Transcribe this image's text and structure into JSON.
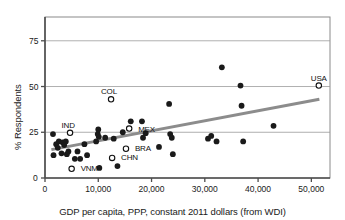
{
  "figure": {
    "clipped_title": "Support for the death penalty",
    "frame": {
      "left": 45,
      "top": 17,
      "right": 330,
      "bottom": 178
    }
  },
  "chart_data": {
    "type": "scatter",
    "title": "",
    "xlabel": "GDP per capita, PPP, constant 2011 dollars (from WDI)",
    "ylabel": "% Respondents",
    "xlim": [
      0,
      53500
    ],
    "ylim": [
      0,
      88
    ],
    "xticks": [
      0,
      10000,
      20000,
      30000,
      40000,
      50000
    ],
    "xticklabels": [
      "0",
      "10,000",
      "20,000",
      "30,000",
      "40,000",
      "50,000"
    ],
    "yticks": [
      0,
      25,
      50,
      75
    ],
    "yticklabels": [
      "0",
      "25",
      "50",
      "75"
    ],
    "grid": "horizontal",
    "gridlines_at": [
      25,
      50,
      75
    ],
    "marker_filled_color": "#1a1a1a",
    "marker_open_color": "#ffffff",
    "trendline_color": "#8c8c8c",
    "trendline": {
      "x0": 1200,
      "y0": 15.5,
      "x1": 51500,
      "y1": 43.0
    },
    "points": [
      {
        "x": 1500,
        "y": 24.0,
        "style": "filled",
        "label": ""
      },
      {
        "x": 1600,
        "y": 12.5,
        "style": "filled",
        "label": ""
      },
      {
        "x": 2100,
        "y": 18.5,
        "style": "filled",
        "label": ""
      },
      {
        "x": 2400,
        "y": 16.5,
        "style": "filled",
        "label": ""
      },
      {
        "x": 2600,
        "y": 20.0,
        "style": "filled",
        "label": ""
      },
      {
        "x": 3100,
        "y": 13.5,
        "style": "filled",
        "label": ""
      },
      {
        "x": 3300,
        "y": 19.5,
        "style": "filled",
        "label": ""
      },
      {
        "x": 3600,
        "y": 18.0,
        "style": "filled",
        "label": ""
      },
      {
        "x": 3900,
        "y": 20.0,
        "style": "filled",
        "label": ""
      },
      {
        "x": 4100,
        "y": 13.0,
        "style": "filled",
        "label": ""
      },
      {
        "x": 4400,
        "y": 14.5,
        "style": "filled",
        "label": ""
      },
      {
        "x": 4700,
        "y": 24.7,
        "style": "open",
        "label": "IND"
      },
      {
        "x": 5000,
        "y": 5.0,
        "style": "open",
        "label": "VNM"
      },
      {
        "x": 5600,
        "y": 10.5,
        "style": "filled",
        "label": ""
      },
      {
        "x": 6100,
        "y": 14.5,
        "style": "filled",
        "label": ""
      },
      {
        "x": 6600,
        "y": 10.5,
        "style": "filled",
        "label": ""
      },
      {
        "x": 7400,
        "y": 18.5,
        "style": "filled",
        "label": ""
      },
      {
        "x": 7900,
        "y": 12.5,
        "style": "filled",
        "label": ""
      },
      {
        "x": 9600,
        "y": 20.0,
        "style": "filled",
        "label": ""
      },
      {
        "x": 9900,
        "y": 24.0,
        "style": "filled",
        "label": ""
      },
      {
        "x": 10000,
        "y": 26.5,
        "style": "filled",
        "label": ""
      },
      {
        "x": 10100,
        "y": 22.5,
        "style": "filled",
        "label": ""
      },
      {
        "x": 10200,
        "y": 5.5,
        "style": "filled",
        "label": ""
      },
      {
        "x": 11300,
        "y": 22.0,
        "style": "filled",
        "label": ""
      },
      {
        "x": 12400,
        "y": 43.0,
        "style": "open",
        "label": "COL"
      },
      {
        "x": 12600,
        "y": 11.0,
        "style": "open",
        "label": "CHN"
      },
      {
        "x": 12900,
        "y": 21.5,
        "style": "filled",
        "label": ""
      },
      {
        "x": 13600,
        "y": 6.5,
        "style": "filled",
        "label": ""
      },
      {
        "x": 14600,
        "y": 25.0,
        "style": "filled",
        "label": ""
      },
      {
        "x": 15200,
        "y": 16.0,
        "style": "open",
        "label": "BRA"
      },
      {
        "x": 15800,
        "y": 27.0,
        "style": "open",
        "label": "MEX"
      },
      {
        "x": 16100,
        "y": 31.0,
        "style": "filled",
        "label": ""
      },
      {
        "x": 18200,
        "y": 31.0,
        "style": "filled",
        "label": ""
      },
      {
        "x": 18400,
        "y": 22.0,
        "style": "filled",
        "label": ""
      },
      {
        "x": 18900,
        "y": 24.5,
        "style": "filled",
        "label": ""
      },
      {
        "x": 21400,
        "y": 17.0,
        "style": "filled",
        "label": ""
      },
      {
        "x": 23300,
        "y": 40.5,
        "style": "filled",
        "label": ""
      },
      {
        "x": 23500,
        "y": 24.0,
        "style": "filled",
        "label": ""
      },
      {
        "x": 23800,
        "y": 22.0,
        "style": "filled",
        "label": ""
      },
      {
        "x": 24000,
        "y": 13.0,
        "style": "filled",
        "label": ""
      },
      {
        "x": 30600,
        "y": 21.5,
        "style": "filled",
        "label": ""
      },
      {
        "x": 31200,
        "y": 23.0,
        "style": "filled",
        "label": ""
      },
      {
        "x": 32200,
        "y": 20.0,
        "style": "filled",
        "label": ""
      },
      {
        "x": 33200,
        "y": 60.5,
        "style": "filled",
        "label": ""
      },
      {
        "x": 36700,
        "y": 50.5,
        "style": "filled",
        "label": ""
      },
      {
        "x": 36900,
        "y": 39.5,
        "style": "filled",
        "label": ""
      },
      {
        "x": 37200,
        "y": 20.0,
        "style": "filled",
        "label": ""
      },
      {
        "x": 42900,
        "y": 28.5,
        "style": "filled",
        "label": ""
      },
      {
        "x": 51400,
        "y": 50.5,
        "style": "open",
        "label": "USA"
      }
    ],
    "labeled_points": [
      {
        "label": "IND",
        "x": 4700,
        "y": 24.7,
        "label_dx": -2,
        "label_dy": -11
      },
      {
        "label": "VNM",
        "x": 5000,
        "y": 5.0,
        "label_dx": 9,
        "label_dy": 0
      },
      {
        "label": "COL",
        "x": 12400,
        "y": 43.0,
        "label_dx": -2,
        "label_dy": -11
      },
      {
        "label": "CHN",
        "x": 12600,
        "y": 11.0,
        "label_dx": 9,
        "label_dy": 0
      },
      {
        "label": "BRA",
        "x": 15200,
        "y": 16.0,
        "label_dx": 9,
        "label_dy": 0
      },
      {
        "label": "MEX",
        "x": 15800,
        "y": 27.0,
        "label_dx": 9,
        "label_dy": 1
      },
      {
        "label": "USA",
        "x": 51400,
        "y": 50.5,
        "label_dx": 0,
        "label_dy": -11
      }
    ]
  }
}
